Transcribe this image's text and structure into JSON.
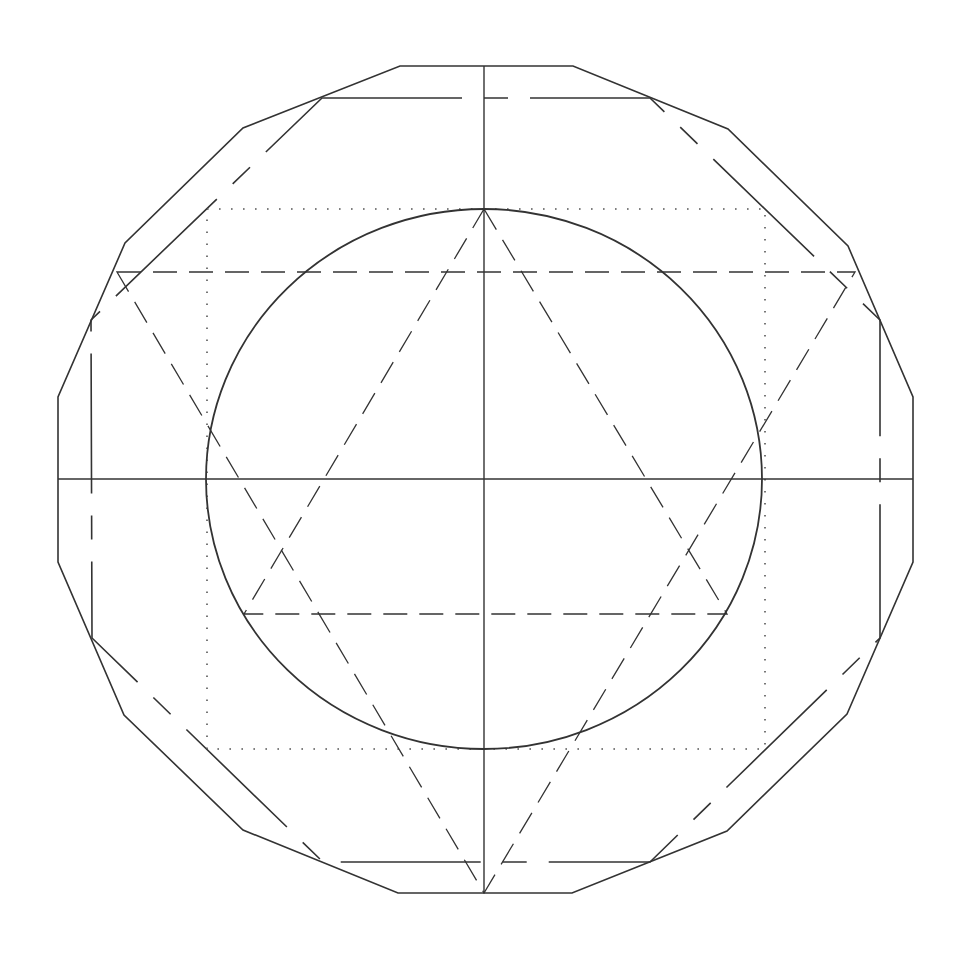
{
  "canvas": {
    "width": 969,
    "height": 957,
    "background": "#ffffff"
  },
  "colors": {
    "line": "#333333",
    "dotted": "#555555"
  },
  "diagram": {
    "center": [
      484,
      479
    ],
    "outer_polygon": {
      "style": "solid",
      "sides": 16,
      "points": [
        [
          400,
          66
        ],
        [
          573,
          66
        ],
        [
          728,
          129
        ],
        [
          848,
          246
        ],
        [
          913,
          397
        ],
        [
          913,
          562
        ],
        [
          847,
          714
        ],
        [
          727,
          831
        ],
        [
          572,
          893
        ],
        [
          398,
          893
        ],
        [
          243,
          830
        ],
        [
          124,
          715
        ],
        [
          58,
          562
        ],
        [
          58,
          397
        ],
        [
          125,
          243
        ],
        [
          243,
          128
        ]
      ]
    },
    "octagon": {
      "style": "dash-dot",
      "points": [
        [
          322,
          98
        ],
        [
          650,
          98
        ],
        [
          880,
          320
        ],
        [
          880,
          638
        ],
        [
          650,
          862
        ],
        [
          323,
          862
        ],
        [
          92,
          638
        ],
        [
          91,
          320
        ]
      ]
    },
    "square": {
      "style": "dotted",
      "x": 207,
      "y": 209,
      "width": 558,
      "height": 540
    },
    "circle": {
      "style": "solid",
      "cx": 484,
      "cy": 479,
      "rx": 278,
      "ry": 270
    },
    "triangle_down": {
      "style": "dashed",
      "points": [
        [
          117,
          272
        ],
        [
          855,
          272
        ],
        [
          484,
          893
        ]
      ]
    },
    "triangle_up": {
      "style": "dashed",
      "points": [
        [
          484,
          209
        ],
        [
          727,
          614
        ],
        [
          244,
          614
        ]
      ]
    },
    "axes": {
      "vertical": {
        "x": 484,
        "y1": 66,
        "y2": 893
      },
      "horizontal": {
        "y": 479,
        "x1": 58,
        "x2": 913
      }
    }
  }
}
